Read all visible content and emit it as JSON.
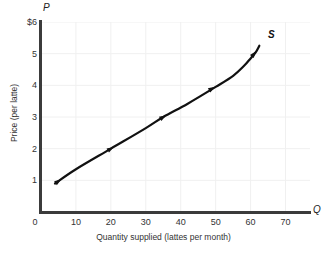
{
  "chart_data": {
    "type": "line",
    "title": "",
    "subtitle": "",
    "xlabel": "Quantity supplied (lattes per month)",
    "ylabel": "Price (per latte)",
    "x_axis_symbol": "Q",
    "y_axis_symbol": "P",
    "xlim": [
      0,
      77
    ],
    "ylim": [
      0,
      6
    ],
    "grid": true,
    "legend_position": "none",
    "x_ticks": [
      {
        "value": 0,
        "label": "0"
      },
      {
        "value": 10,
        "label": "10"
      },
      {
        "value": 20,
        "label": "20"
      },
      {
        "value": 30,
        "label": "30"
      },
      {
        "value": 40,
        "label": "40"
      },
      {
        "value": 50,
        "label": "50"
      },
      {
        "value": 60,
        "label": "60"
      },
      {
        "value": 70,
        "label": "70"
      }
    ],
    "y_ticks": [
      {
        "value": 6,
        "label": "$6"
      },
      {
        "value": 5,
        "label": "5"
      },
      {
        "value": 4,
        "label": "4"
      },
      {
        "value": 3,
        "label": "3"
      },
      {
        "value": 2,
        "label": "2"
      },
      {
        "value": 1,
        "label": "1"
      }
    ],
    "series": [
      {
        "name": "S",
        "annotation": "S",
        "curve_color": "#111111",
        "x": [
          4,
          10,
          20,
          30,
          35,
          42,
          50,
          55,
          58,
          60,
          61.5,
          62.5
        ],
        "y": [
          0.9,
          1.35,
          2.0,
          2.65,
          3.0,
          3.42,
          3.95,
          4.3,
          4.6,
          4.85,
          5.05,
          5.25
        ]
      }
    ],
    "markers": [
      {
        "x": 5,
        "y": 0.97
      },
      {
        "x": 20,
        "y": 2.0
      },
      {
        "x": 35,
        "y": 3.0
      },
      {
        "x": 49,
        "y": 3.9
      },
      {
        "x": 61,
        "y": 5.0
      }
    ],
    "colors": {
      "axis": "#3b3b3b",
      "grid": "#f0f0f0",
      "curve": "#111111",
      "text": "#333333",
      "background": "#ffffff"
    }
  }
}
